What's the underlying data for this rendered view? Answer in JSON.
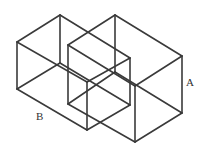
{
  "diagram": {
    "stroke_color": "#3a3a3a",
    "background": "#ffffff",
    "cubes": [
      {
        "label": "A",
        "label_pos": [
          186,
          86
        ],
        "vertices": {
          "top": [
            [
              68,
              45
            ],
            [
              115,
              15
            ],
            [
              182,
              56
            ],
            [
              135,
              86
            ]
          ],
          "bottom": [
            [
              68,
              104
            ],
            [
              115,
              72
            ],
            [
              182,
              113
            ],
            [
              135,
              142
            ]
          ]
        }
      },
      {
        "label": "B",
        "label_pos": [
          36,
          120
        ],
        "vertices": {
          "top": [
            [
              17,
              42
            ],
            [
              60,
              15
            ],
            [
              130,
              58
            ],
            [
              87,
              82
            ]
          ],
          "bottom": [
            [
              17,
              89
            ],
            [
              60,
              63
            ],
            [
              130,
              105
            ],
            [
              87,
              130
            ]
          ]
        }
      }
    ]
  }
}
